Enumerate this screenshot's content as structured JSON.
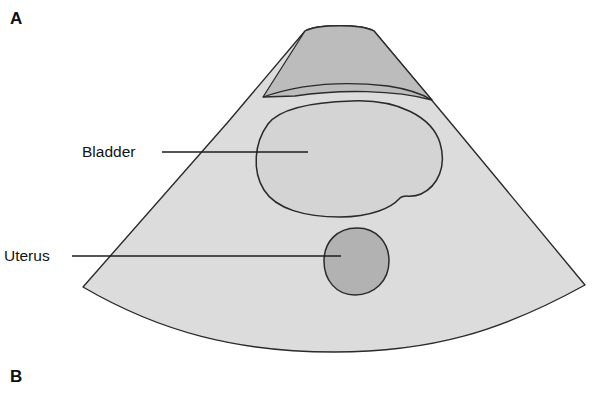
{
  "figure": {
    "panels": [
      {
        "id": "a",
        "letter": "A"
      },
      {
        "id": "b",
        "letter": "B"
      }
    ],
    "annotations": [
      {
        "id": "bladder",
        "label": "Bladder"
      },
      {
        "id": "uterus",
        "label": "Uterus"
      }
    ]
  },
  "colors": {
    "background": "#ffffff",
    "scan_field_fill": "#dcdcdc",
    "near_field_band_fill": "#bcbcbc",
    "bladder_fill": "#d4d4d4",
    "uterus_fill": "#b2b2b2",
    "outline": "#2a2a2a",
    "leader_line": "#1e1e1e",
    "text": "#131313"
  },
  "graphic": {
    "type": "ultrasound-sector-scan-schematic",
    "scan_sector": {
      "apex_arc_left": [
        305,
        31
      ],
      "apex_arc_right": [
        374,
        31
      ],
      "bottom_arc_left": [
        83,
        287
      ],
      "bottom_arc_right": [
        585,
        285
      ]
    },
    "structures": [
      {
        "name": "near-field-band",
        "shape": "curved-band"
      },
      {
        "name": "bladder",
        "shape": "bilobed-rounded"
      },
      {
        "name": "uterus",
        "shape": "oval"
      }
    ],
    "leader_lines": [
      {
        "for": "bladder",
        "from": [
          162,
          152
        ],
        "to": [
          308,
          152
        ]
      },
      {
        "for": "uterus",
        "from": [
          72,
          256
        ],
        "to": [
          341,
          256
        ]
      }
    ]
  }
}
